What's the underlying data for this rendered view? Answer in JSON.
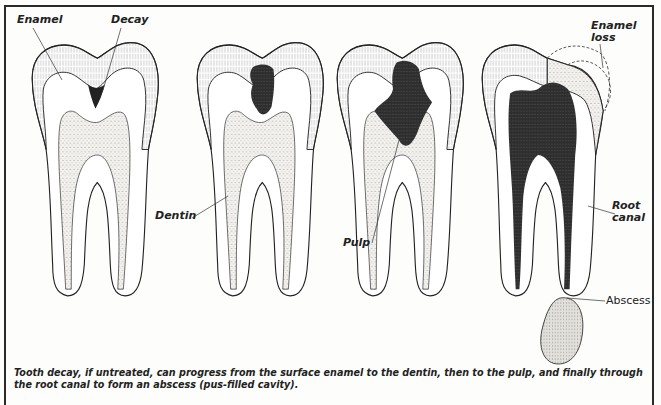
{
  "diagram": {
    "stages": [
      {
        "id": 1,
        "labels": [
          "Enamel",
          "Decay",
          "Dentin"
        ]
      },
      {
        "id": 2,
        "labels": []
      },
      {
        "id": 3,
        "labels": [
          "Pulp"
        ]
      },
      {
        "id": 4,
        "labels": [
          "Enamel loss",
          "Root canal",
          "Abscess"
        ]
      }
    ],
    "labels": {
      "enamel": "Enamel",
      "decay": "Decay",
      "dentin": "Dentin",
      "pulp": "Pulp",
      "enamel_loss_1": "Enamel",
      "enamel_loss_2": "loss",
      "root_canal_1": "Root",
      "root_canal_2": "canal",
      "abscess": "Abscess"
    },
    "caption": "Tooth decay, if untreated, can progress from the surface enamel to the dentin, then to the pulp, and finally through the root canal to form an abscess (pus-filled cavity).",
    "colors": {
      "ink": "#222222",
      "decay": "#2b2b2b",
      "stipple": "#e6e4de",
      "abscess": "#d9d7d2",
      "paper": "#fdfdfb"
    }
  }
}
